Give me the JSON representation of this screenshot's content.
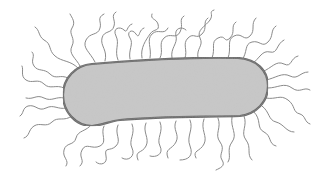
{
  "figure": {
    "subject": "rod-shaped bacterium (bacillus) with peritrichous flagella",
    "body_fill": "#c8c8c8",
    "body_outline": "#5f5f5f",
    "flagella_color": "#8a8a8a",
    "background": "#ffffff"
  }
}
